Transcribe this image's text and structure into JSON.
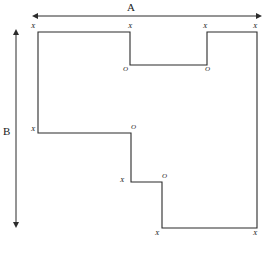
{
  "figure": {
    "type": "orthogonal-polygon-outline-diagram",
    "background_color": "#ffffff",
    "stroke_color": "#2b2b2b",
    "stroke_width": 1.1,
    "canvas": {
      "width": 265,
      "height": 254
    },
    "polygon_points": "38,32 130,32 130,65 207,65 207,32 257,32 257,228 162,228 162,182 131,182 131,133 38,133 38,32",
    "dimension_lines": {
      "horizontal": {
        "label": "A",
        "label_x": 127,
        "label_y": 2,
        "x1": 38,
        "x2": 256,
        "y": 16,
        "arrow_both_ends": true
      },
      "vertical": {
        "label": "B",
        "label_x": 3,
        "label_y": 126,
        "x": 16,
        "y1": 35,
        "y2": 222,
        "arrow_both_ends": true
      }
    },
    "vertex_labels": [
      {
        "text": "X",
        "x": 31,
        "y": 23,
        "name": "vertex-label-x-top-left"
      },
      {
        "text": "X",
        "x": 128,
        "y": 23,
        "name": "vertex-label-x-notch-left-top"
      },
      {
        "text": "O",
        "x": 123,
        "y": 66,
        "name": "vertex-label-o-notch-left-bottom"
      },
      {
        "text": "O",
        "x": 205,
        "y": 66,
        "name": "vertex-label-o-notch-right-bottom"
      },
      {
        "text": "X",
        "x": 203,
        "y": 23,
        "name": "vertex-label-x-notch-right-top"
      },
      {
        "text": "X",
        "x": 253,
        "y": 23,
        "name": "vertex-label-x-top-right"
      },
      {
        "text": "X",
        "x": 31,
        "y": 126,
        "name": "vertex-label-x-left-step"
      },
      {
        "text": "O",
        "x": 131,
        "y": 124,
        "name": "vertex-label-o-middle-step"
      },
      {
        "text": "X",
        "x": 120,
        "y": 177,
        "name": "vertex-label-x-lower-step-left"
      },
      {
        "text": "O",
        "x": 162,
        "y": 173,
        "name": "vertex-label-o-lower-step-right"
      },
      {
        "text": "X",
        "x": 155,
        "y": 230,
        "name": "vertex-label-x-bottom-left"
      },
      {
        "text": "X",
        "x": 253,
        "y": 230,
        "name": "vertex-label-x-bottom-right"
      }
    ]
  }
}
